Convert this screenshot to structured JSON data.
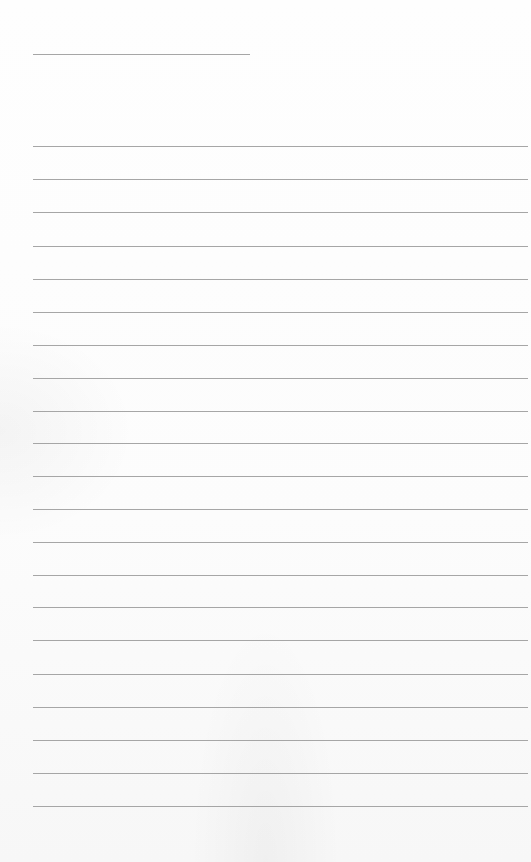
{
  "_note": "The screenshot contains no visible text or values. The fields below are derived render parameters (layout), not content read from the page.",
  "sheet": {
    "paper_color": "#ffffff",
    "rule_color": "#9c9c9c",
    "header_rule": {
      "y": 54,
      "x_start": 33,
      "x_end": 250
    },
    "body_rules": {
      "x_start": 33,
      "x_end": 528,
      "y_positions": [
        146,
        179,
        212,
        246,
        279,
        312,
        345,
        378,
        411,
        443,
        476,
        509,
        542,
        575,
        607,
        640,
        674,
        707,
        740,
        773,
        806
      ]
    }
  }
}
